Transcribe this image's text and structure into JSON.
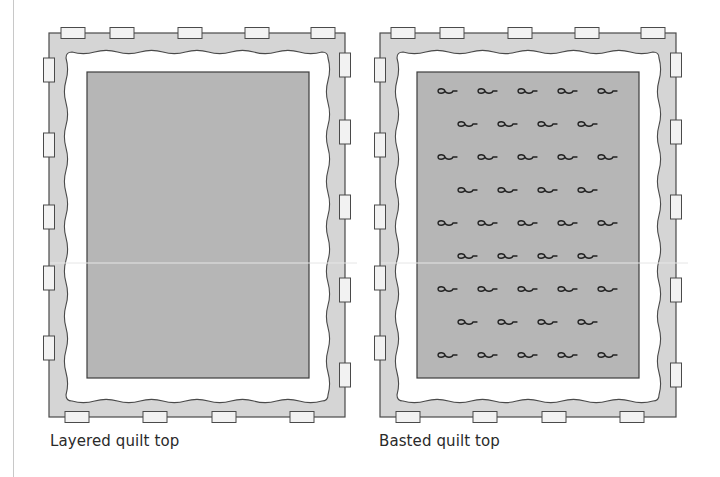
{
  "colors": {
    "frame_fill": "#d5d5d5",
    "frame_stroke": "#4a4a4a",
    "batting_fill": "#ffffff",
    "quilt_fill": "#b6b6b6",
    "quilt_stroke": "#3c3c3c",
    "tape_fill": "#f2f2f2",
    "tape_stroke": "#4a4a4a",
    "pin_stroke": "#222222",
    "seam_line": "#e6e6e6"
  },
  "panels": [
    {
      "id": "layered",
      "caption": "Layered quilt top",
      "caption_pos": {
        "x": 50,
        "y": 432
      },
      "frame": {
        "x": 49,
        "y": 33,
        "w": 296,
        "h": 384
      },
      "quilt": {
        "x": 87,
        "y": 72,
        "w": 222,
        "h": 306
      },
      "seam_y": 263,
      "tapes_top_x": [
        73,
        122,
        190,
        257,
        323
      ],
      "tapes_bottom_x": [
        77,
        155,
        224,
        302
      ],
      "tapes_left_y": [
        70,
        145,
        217,
        278,
        348
      ],
      "tapes_right_y": [
        65,
        132,
        207,
        290,
        375
      ],
      "pins": []
    },
    {
      "id": "basted",
      "caption": "Basted quilt top",
      "caption_pos": {
        "x": 379,
        "y": 432
      },
      "frame": {
        "x": 380,
        "y": 33,
        "w": 296,
        "h": 384
      },
      "quilt": {
        "x": 417,
        "y": 72,
        "w": 222,
        "h": 306
      },
      "seam_y": 263,
      "tapes_top_x": [
        403,
        452,
        520,
        587,
        653
      ],
      "tapes_bottom_x": [
        408,
        485,
        554,
        632
      ],
      "tapes_left_y": [
        70,
        145,
        217,
        278,
        348
      ],
      "tapes_right_y": [
        65,
        132,
        207,
        290,
        375
      ],
      "pins": {
        "row_y": [
          91,
          124,
          157,
          190,
          223,
          256,
          289,
          322,
          355
        ],
        "odd_row_x": [
          448,
          488,
          528,
          568,
          608
        ],
        "even_row_x": [
          468,
          508,
          548,
          588
        ]
      }
    }
  ]
}
